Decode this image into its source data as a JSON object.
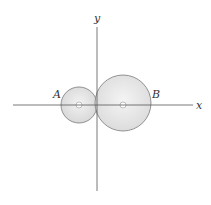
{
  "diagram": {
    "axes": {
      "x_label": "x",
      "y_label": "y",
      "color": "#555555"
    },
    "disks": [
      {
        "label": "A",
        "cx": 79,
        "cy": 105,
        "r": 18,
        "fill": "#e2e2e2",
        "stroke": "#7a7a7a"
      },
      {
        "label": "B",
        "cx": 123,
        "cy": 103,
        "r": 28,
        "fill": "#e6e6e6",
        "stroke": "#7a7a7a"
      }
    ]
  }
}
